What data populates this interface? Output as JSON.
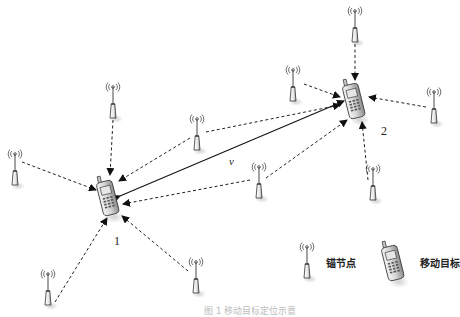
{
  "diagram": {
    "type": "wireless-localization-network",
    "targets": [
      {
        "id": "1",
        "label": "1",
        "x": 108,
        "y": 198
      },
      {
        "id": "2",
        "label": "2",
        "x": 354,
        "y": 101
      }
    ],
    "velocity_label": "v",
    "anchors": [
      {
        "x": 355,
        "y": 32,
        "target": "2"
      },
      {
        "x": 293,
        "y": 90,
        "target": "2"
      },
      {
        "x": 434,
        "y": 112,
        "target": "2"
      },
      {
        "x": 373,
        "y": 190,
        "target": "2"
      },
      {
        "x": 197,
        "y": 140,
        "target": "both"
      },
      {
        "x": 259,
        "y": 187,
        "target": "both"
      },
      {
        "x": 113,
        "y": 108,
        "target": "1"
      },
      {
        "x": 15,
        "y": 175,
        "target": "1"
      },
      {
        "x": 196,
        "y": 282,
        "target": "1"
      },
      {
        "x": 48,
        "y": 296,
        "target": "1"
      }
    ],
    "legend": {
      "anchor_label": "锚节点",
      "target_label": "移动目标"
    },
    "caption": "图 1  移动目标定位示意"
  }
}
